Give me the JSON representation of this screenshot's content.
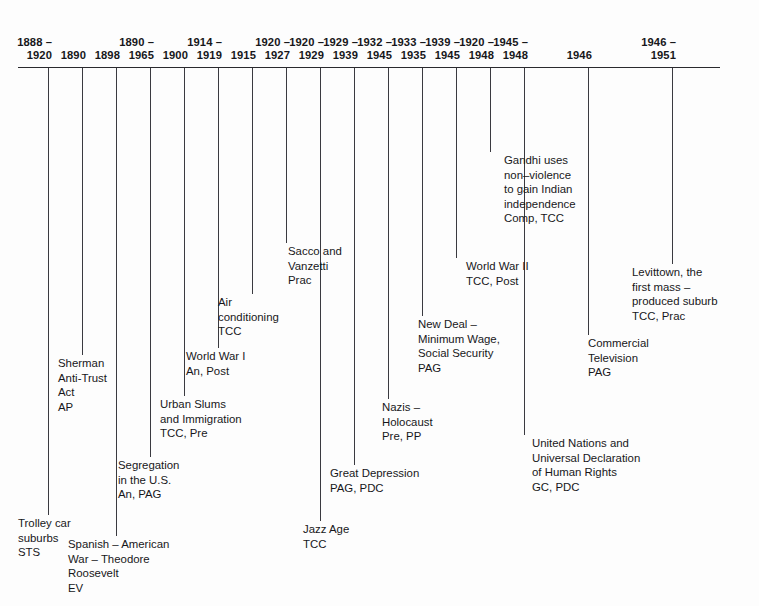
{
  "page": {
    "background_color": "#fdfdfd",
    "line_color": "#2a2a2e",
    "text_color": "#17171a"
  },
  "axis": {
    "name": "timeline-axis",
    "start_year": 1888,
    "end_year": 1951
  },
  "entries": [
    {
      "id": "trolley-car-suburbs",
      "date_from": "1888 –",
      "date_to": "1920",
      "tick_x": 48,
      "line_bottom": 515,
      "label_x": 18,
      "label_y": 516,
      "lines": [
        "Trolley car",
        "suburbs",
        "STS"
      ]
    },
    {
      "id": "sherman-anti-trust-act",
      "date_from": "",
      "date_to": "1890",
      "tick_x": 82,
      "line_bottom": 355,
      "label_x": 58,
      "label_y": 356,
      "lines": [
        "Sherman",
        "Anti-Trust",
        "Act",
        "AP"
      ]
    },
    {
      "id": "spanish-american-war",
      "date_from": "",
      "date_to": "1898",
      "tick_x": 116,
      "line_bottom": 536,
      "label_x": 68,
      "label_y": 537,
      "lines": [
        "Spanish – American",
        "War – Theodore",
        "Roosevelt",
        "EV"
      ]
    },
    {
      "id": "segregation-in-the-us",
      "date_from": "1890 –",
      "date_to": "1965",
      "tick_x": 150,
      "line_bottom": 457,
      "label_x": 118,
      "label_y": 458,
      "lines": [
        "Segregation",
        "in the U.S.",
        "An, PAG"
      ]
    },
    {
      "id": "urban-slums-and-immigration",
      "date_from": "",
      "date_to": "1900",
      "tick_x": 184,
      "line_bottom": 396,
      "label_x": 160,
      "label_y": 397,
      "lines": [
        "Urban Slums",
        "and Immigration",
        "TCC, Pre"
      ]
    },
    {
      "id": "world-war-i",
      "date_from": "1914 –",
      "date_to": "1919",
      "tick_x": 218,
      "line_bottom": 348,
      "label_x": 186,
      "label_y": 349,
      "lines": [
        "World War I",
        "An, Post"
      ]
    },
    {
      "id": "air-conditioning",
      "date_from": "",
      "date_to": "1915",
      "tick_x": 252,
      "line_bottom": 294,
      "label_x": 218,
      "label_y": 295,
      "lines": [
        "Air",
        "conditioning",
        "TCC"
      ]
    },
    {
      "id": "sacco-and-vanzetti",
      "date_from": "1920 –",
      "date_to": "1927",
      "tick_x": 286,
      "line_bottom": 243,
      "label_x": 288,
      "label_y": 244,
      "lines": [
        "Sacco and",
        "Vanzetti",
        "Prac"
      ]
    },
    {
      "id": "jazz-age",
      "date_from": "1920 –",
      "date_to": "1929",
      "tick_x": 320,
      "line_bottom": 521,
      "label_x": 303,
      "label_y": 522,
      "lines": [
        "Jazz Age",
        "TCC"
      ]
    },
    {
      "id": "great-depression",
      "date_from": "1929 –",
      "date_to": "1939",
      "tick_x": 354,
      "line_bottom": 465,
      "label_x": 330,
      "label_y": 466,
      "lines": [
        "Great Depression",
        "PAG, PDC"
      ]
    },
    {
      "id": "nazis-holocaust",
      "date_from": "1932 –",
      "date_to": "1945",
      "tick_x": 388,
      "line_bottom": 399,
      "label_x": 382,
      "label_y": 400,
      "lines": [
        "Nazis –",
        "Holocaust",
        "Pre, PP"
      ]
    },
    {
      "id": "new-deal",
      "date_from": "1933 –",
      "date_to": "1935",
      "tick_x": 422,
      "line_bottom": 316,
      "label_x": 418,
      "label_y": 317,
      "lines": [
        "New Deal –",
        "Minimum Wage,",
        "Social Security",
        "PAG"
      ]
    },
    {
      "id": "world-war-ii",
      "date_from": "1939 –",
      "date_to": "1945",
      "tick_x": 456,
      "line_bottom": 258,
      "label_x": 466,
      "label_y": 259,
      "lines": [
        "World War II",
        "TCC, Post"
      ]
    },
    {
      "id": "gandhi-non-violence",
      "date_from": "1920 –",
      "date_to": "1948",
      "tick_x": 490,
      "line_bottom": 152,
      "label_x": 504,
      "label_y": 153,
      "lines": [
        "Gandhi uses",
        "non–violence",
        "to gain Indian",
        "independence",
        "Comp, TCC"
      ]
    },
    {
      "id": "united-nations-human-rights",
      "date_from": "1945 –",
      "date_to": "1948",
      "tick_x": 524,
      "line_bottom": 435,
      "label_x": 532,
      "label_y": 436,
      "lines": [
        "United Nations and",
        "Universal Declaration",
        "of Human Rights",
        "GC, PDC"
      ]
    },
    {
      "id": "commercial-television",
      "date_from": "",
      "date_to": "1946",
      "tick_x": 588,
      "line_bottom": 335,
      "label_x": 588,
      "label_y": 336,
      "lines": [
        "Commercial",
        "Television",
        "PAG"
      ]
    },
    {
      "id": "levittown",
      "date_from": "1946 –",
      "date_to": "1951",
      "tick_x": 672,
      "line_bottom": 264,
      "label_x": 632,
      "label_y": 265,
      "lines": [
        "Levittown, the",
        "first mass –",
        "produced suburb",
        "TCC, Prac"
      ]
    }
  ]
}
